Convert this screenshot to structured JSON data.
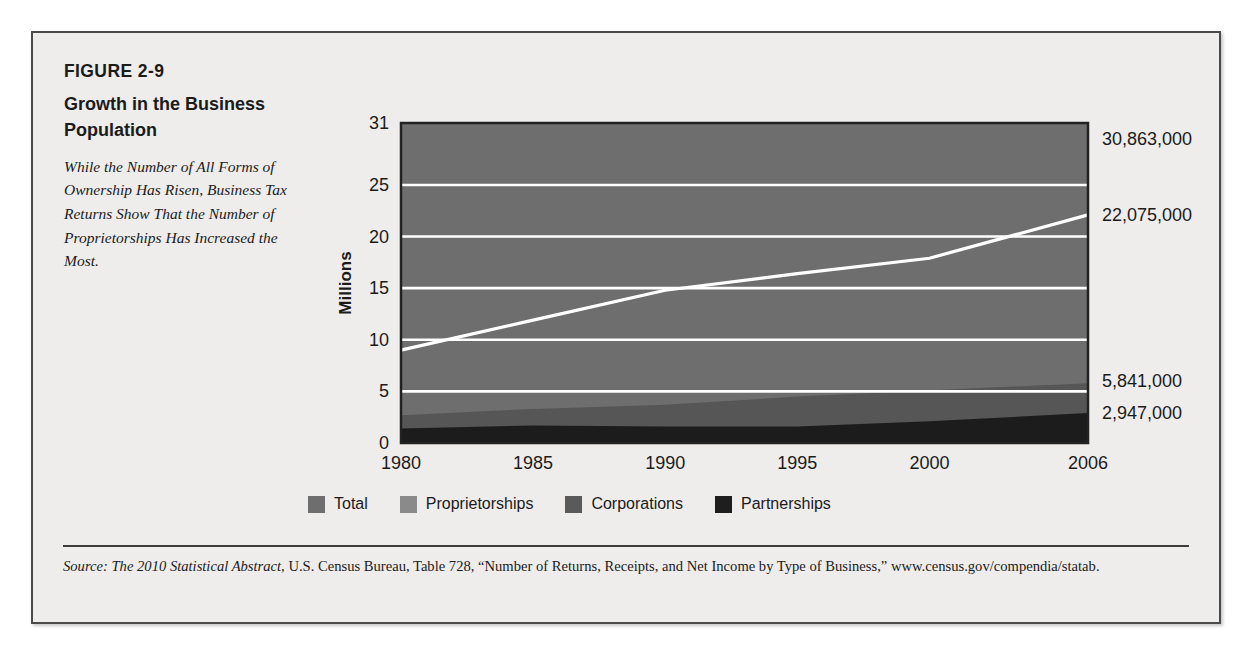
{
  "figure": {
    "number": "FIGURE 2-9",
    "title": "Growth in the Business Population",
    "subtitle": "While the Number of All Forms of Ownership Has Risen, Business Tax Returns Show That the Number of Proprietorships Has Increased the Most."
  },
  "source": {
    "lead": "Source: ",
    "title": "The 2010 Statistical Abstract,",
    "rest": " U.S. Census Bureau, Table 728, “Number of Returns, Receipts, and Net Income by Type of Business,” www.census.gov/compendia/statab."
  },
  "legend": {
    "items": [
      {
        "label": "Total",
        "color": "#6e6e6e"
      },
      {
        "label": "Proprietorships",
        "color": "#8a8a8a"
      },
      {
        "label": "Corporations",
        "color": "#5a5a5a"
      },
      {
        "label": "Partnerships",
        "color": "#1e1e1e"
      }
    ]
  },
  "colors": {
    "total_area": "#6e6e6e",
    "proprietorships_area": "#787878",
    "corporations_area": "#565656",
    "partnerships_area": "#1c1c1c",
    "gridline": "#ffffff",
    "plot_border": "#222222",
    "page_background": "#eeedeb",
    "text": "#1b1b1b"
  },
  "chart_data": {
    "type": "area",
    "title": "Growth in the Business Population",
    "xlabel": "Year",
    "ylabel": "Millions",
    "xlim": [
      1980,
      2006
    ],
    "ylim": [
      0,
      31
    ],
    "grid": true,
    "grid_color": "#ffffff",
    "legend_position": "bottom",
    "xticks": [
      "1980",
      "1985",
      "1990",
      "1995",
      "2000",
      "2006"
    ],
    "xtick_values": [
      1980,
      1985,
      1990,
      1995,
      2000,
      2006
    ],
    "yticks": [
      "0",
      "5",
      "10",
      "15",
      "20",
      "25",
      "31"
    ],
    "ytick_values": [
      0,
      5,
      10,
      15,
      20,
      25,
      31
    ],
    "x": [
      1980,
      1985,
      1990,
      1995,
      2000,
      2006
    ],
    "series": [
      {
        "name": "Total",
        "color": "#6e6e6e",
        "values": [
          16.8,
          19.8,
          23.0,
          26.2,
          28.6,
          30.9
        ]
      },
      {
        "name": "Proprietorships",
        "color": "#787878",
        "values": [
          9.0,
          11.9,
          14.8,
          16.4,
          17.9,
          22.1
        ]
      },
      {
        "name": "Corporations",
        "color": "#565656",
        "values": [
          2.7,
          3.3,
          3.7,
          4.5,
          5.1,
          5.8
        ]
      },
      {
        "name": "Partnerships",
        "color": "#1c1c1c",
        "values": [
          1.4,
          1.7,
          1.6,
          1.6,
          2.1,
          2.9
        ]
      }
    ],
    "endpoint_labels": [
      {
        "text": "30,863,000",
        "series": "Total",
        "value": 30.863
      },
      {
        "text": "22,075,000",
        "series": "Proprietorships",
        "value": 22.075
      },
      {
        "text": "5,841,000",
        "series": "Corporations",
        "value": 5.841
      },
      {
        "text": "2,947,000",
        "series": "Partnerships",
        "value": 2.947
      }
    ]
  }
}
